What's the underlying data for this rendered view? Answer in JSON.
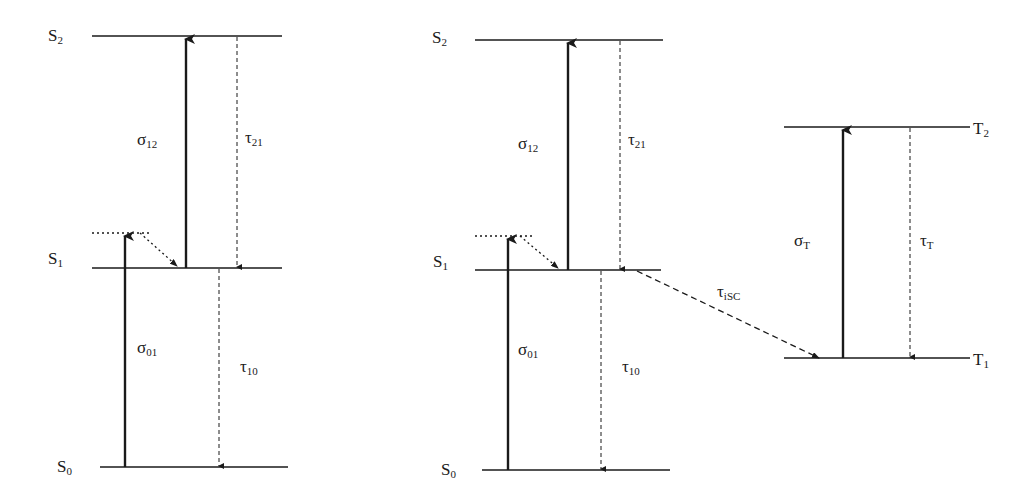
{
  "diagram": {
    "type": "energy-level (Jablonski) diagram",
    "colors": {
      "line": "#1a1a1a",
      "background": "#ffffff"
    },
    "panels": [
      {
        "id": "left",
        "levels": [
          {
            "name": "S",
            "sub": "2"
          },
          {
            "name": "S",
            "sub": "1"
          },
          {
            "name": "S",
            "sub": "0"
          }
        ],
        "transitions": [
          {
            "symbol": "σ",
            "sub": "12",
            "kind": "absorption"
          },
          {
            "symbol": "τ",
            "sub": "21",
            "kind": "decay"
          },
          {
            "symbol": "σ",
            "sub": "01",
            "kind": "absorption"
          },
          {
            "symbol": "τ",
            "sub": "10",
            "kind": "decay"
          }
        ]
      },
      {
        "id": "middle",
        "levels": [
          {
            "name": "S",
            "sub": "2"
          },
          {
            "name": "S",
            "sub": "1"
          },
          {
            "name": "S",
            "sub": "0"
          }
        ],
        "transitions": [
          {
            "symbol": "σ",
            "sub": "12",
            "kind": "absorption"
          },
          {
            "symbol": "τ",
            "sub": "21",
            "kind": "decay"
          },
          {
            "symbol": "σ",
            "sub": "01",
            "kind": "absorption"
          },
          {
            "symbol": "τ",
            "sub": "10",
            "kind": "decay"
          },
          {
            "symbol": "τ",
            "sub": "iSC",
            "kind": "intersystem crossing"
          }
        ]
      },
      {
        "id": "right",
        "levels": [
          {
            "name": "T",
            "sub": "2"
          },
          {
            "name": "T",
            "sub": "1"
          }
        ],
        "transitions": [
          {
            "symbol": "σ",
            "sub": "T",
            "kind": "absorption"
          },
          {
            "symbol": "τ",
            "sub": "T",
            "kind": "decay"
          }
        ]
      }
    ]
  }
}
